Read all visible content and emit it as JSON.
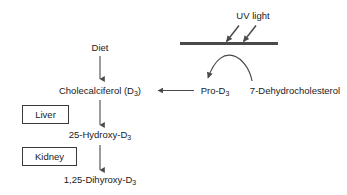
{
  "diagram": {
    "colors": {
      "text": "#1a1a1a",
      "line": "#4a4a4a",
      "skin_bar": "#4a4a4a",
      "box_border": "#3a3a3a",
      "background": "#ffffff"
    },
    "labels": {
      "uv_light": "UV light",
      "diet": "Diet",
      "cholecalciferol": "Cholecalciferol (D",
      "cholecalciferol_sub": "3",
      "cholecalciferol_tail": ")",
      "pro_d3": "Pro-D",
      "pro_d3_sub": "3",
      "dehydrocholesterol": "7-Dehydrocholesterol",
      "hydroxy_d3": "25-Hydroxy-D",
      "hydroxy_d3_sub": "3",
      "dihyroxy_d3": "1,25-Dihyroxy-D",
      "dihyroxy_d3_sub": "3"
    },
    "organs": {
      "liver": "Liver",
      "kidney": "Kidney"
    }
  }
}
